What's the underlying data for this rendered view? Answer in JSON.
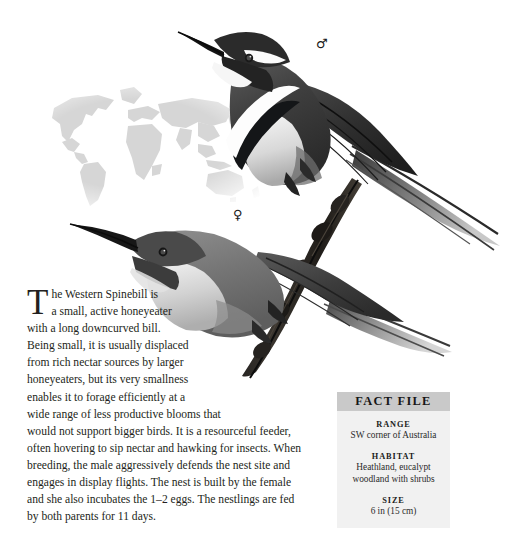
{
  "page": {
    "background_color": "#ffffff",
    "width": 510,
    "height": 546
  },
  "illustration": {
    "map_label": "world-distribution-map",
    "map_land_color": "#d4d4d4",
    "male_bird_label": "western-spinebill-male-illustration",
    "female_bird_label": "western-spinebill-female-illustration",
    "perch_label": "branch-perch",
    "plumage_dark": "#3c3c3c",
    "plumage_mid": "#8e8e8e",
    "plumage_light": "#d8d8d8",
    "band_white": "#ffffff",
    "band_black": "#16181a"
  },
  "symbols": {
    "male": "♂",
    "female": "♀"
  },
  "article": {
    "dropcap": "T",
    "line_1": "he Western Spinebill is",
    "line_2": "a small, active honeyeater",
    "line_3": "with a long downcurved bill.",
    "line_4": "Being small, it is usually displaced",
    "line_5": "from rich nectar sources by larger",
    "line_6": "honeyeaters, but its very smallness",
    "line_7": "enables it to forage efficiently at a",
    "line_8": "wide range of less productive blooms that",
    "line_9": "would not support bigger birds. It is a resourceful feeder,",
    "line_10": "often hovering to sip nectar and hawking for insects. When",
    "line_11": "breeding, the male aggressively defends the nest site and",
    "line_12": "engages in display flights. The nest is built by the female",
    "line_13": "and she also incubates the 1–2 eggs. The nestlings are fed",
    "line_14": "by both parents for 11 days."
  },
  "fact_file": {
    "title": "FACT FILE",
    "header_background": "#c9c9c9",
    "body_background": "#f1f1f1",
    "entries": [
      {
        "label": "RANGE",
        "value": "SW corner of Australia"
      },
      {
        "label": "HABITAT",
        "value_line_1": "Heathland, eucalypt",
        "value_line_2": "woodland with shrubs"
      },
      {
        "label": "SIZE",
        "value": "6 in (15 cm)"
      }
    ]
  }
}
